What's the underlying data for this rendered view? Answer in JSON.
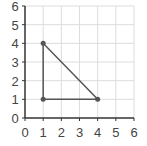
{
  "chart_data": {
    "type": "scatter",
    "title": "",
    "xlabel": "",
    "ylabel": "",
    "xlim": [
      0,
      6
    ],
    "ylim": [
      0,
      6
    ],
    "grid": true,
    "x_ticks": [
      "0",
      "1",
      "2",
      "3",
      "4",
      "5",
      "6"
    ],
    "y_ticks": [
      "0",
      "1",
      "2",
      "3",
      "4",
      "5",
      "6"
    ],
    "series": [
      {
        "name": "triangle",
        "points": [
          [
            1,
            4
          ],
          [
            1,
            1
          ],
          [
            4,
            1
          ]
        ],
        "closed": true,
        "color": "#555555"
      }
    ]
  }
}
